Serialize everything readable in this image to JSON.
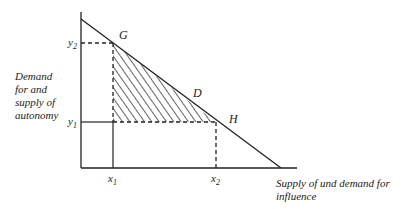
{
  "diagram": {
    "y_axis_label_lines": [
      "Demand",
      "for and",
      "supply of",
      "autonomy"
    ],
    "x_axis_label_lines": [
      "Supply of und demand for",
      "influence"
    ],
    "points": {
      "G": "G",
      "D": "D",
      "H": "H"
    },
    "ticks": {
      "y2": {
        "base": "y",
        "sub": "2"
      },
      "y1": {
        "base": "y",
        "sub": "1"
      },
      "x1": {
        "base": "x",
        "sub": "1"
      },
      "x2": {
        "base": "x",
        "sub": "2"
      }
    },
    "colors": {
      "ink": "#222222",
      "background": "#ffffff"
    }
  }
}
